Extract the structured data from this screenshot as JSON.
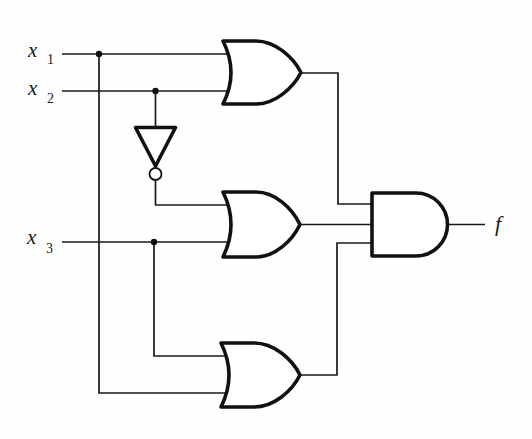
{
  "diagram": {
    "type": "logic-circuit",
    "inputs": [
      {
        "name": "x",
        "subscript": "1"
      },
      {
        "name": "x",
        "subscript": "2"
      },
      {
        "name": "x",
        "subscript": "3"
      }
    ],
    "output": {
      "name": "f"
    },
    "gates": [
      {
        "id": "not-1",
        "type": "NOT",
        "inputs": [
          "x2"
        ],
        "output": "x2'"
      },
      {
        "id": "or-1",
        "type": "OR",
        "inputs": [
          "x1",
          "x2"
        ]
      },
      {
        "id": "or-2",
        "type": "OR",
        "inputs": [
          "x2'",
          "x3"
        ]
      },
      {
        "id": "or-3",
        "type": "OR",
        "inputs": [
          "x3",
          "x1"
        ]
      },
      {
        "id": "and-1",
        "type": "AND",
        "inputs": [
          "or-1",
          "or-2",
          "or-3"
        ],
        "output": "f"
      }
    ],
    "junctions": [
      "x1-branch",
      "x2-branch",
      "x3-branch"
    ],
    "colors": {
      "ink": "#111111",
      "background": "#ffffff"
    }
  }
}
